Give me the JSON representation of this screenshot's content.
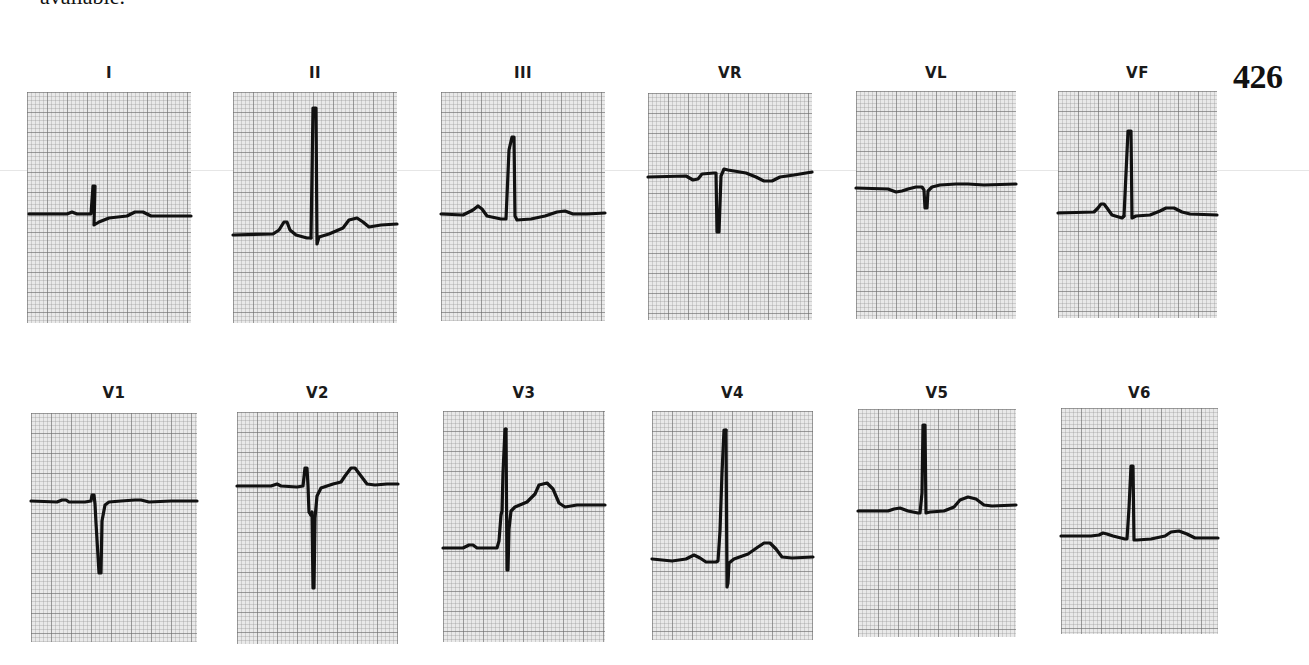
{
  "page": {
    "cut_text": "available.",
    "figure_number": "426"
  },
  "leads": [
    {
      "label": "I",
      "x": 27,
      "label_y": 64,
      "grid_top": 92,
      "w": 164,
      "h": 231,
      "trace": "M2,122 L60,121 L64,119 L67,121 L64,121",
      "path": "M2,122 L40,122 L45,120 L50,122 L64,122 L66,94 L68,94 L67,133 L72,130 L82,126 L100,124 L108,120 L116,120 L124,124 L140,124 L164,124",
      "spike": ""
    },
    {
      "label": "II",
      "x": 233,
      "label_y": 64,
      "grid_top": 92,
      "w": 164,
      "h": 231,
      "path": "M0,143 L40,142 L46,138 L51,130 L54,130 L57,138 L63,143 L74,146 L78,146",
      "spike": "M78,146 L80,16 L83,16 L84,152 L86,145 L96,142 L110,136 L116,128 L124,126 L130,130 L136,135 L148,133 L164,132"
    },
    {
      "label": "III",
      "x": 441,
      "label_y": 64,
      "grid_top": 92,
      "w": 164,
      "h": 229,
      "path": "M0,122 L22,123 L32,118 L37,114 L41,117 L46,124 L60,127 L65,127 L68,58 L71,45 L73,45 L74,124 L76,128 L90,127 L104,124 L116,120 L124,119 L132,122 L146,122 L164,121",
      "spike": ""
    },
    {
      "label": "VR",
      "x": 648,
      "label_y": 64,
      "grid_top": 93,
      "w": 164,
      "h": 227,
      "path": "M0,84 L38,83 L45,87 L50,86 L54,81 L66,80 L68,80 L69,139 L71,139 L73,83 L76,76 L80,77 L98,80 L108,84 L116,88 L124,88 L132,84 L146,82 L164,79",
      "spike": ""
    },
    {
      "label": "VL",
      "x": 856,
      "label_y": 64,
      "grid_top": 91,
      "w": 160,
      "h": 228,
      "path": "M0,97 L32,98 L40,101 L46,100 L52,98 L60,96 L64,96 L66,96 L68,99 L69,117 L71,117 L72,100 L76,96 L84,94 L100,93 L112,93 L128,94 L160,93",
      "spike": ""
    },
    {
      "label": "VF",
      "x": 1058,
      "label_y": 64,
      "grid_top": 91,
      "w": 159,
      "h": 227,
      "path": "M0,122 L36,121 L40,117 L43,113 L46,113 L49,117 L54,124 L64,127 L66,125",
      "spike": "M66,125 L70,40 L73,40 L74,127 L78,125 L92,124 L102,120 L108,117 L116,117 L124,121 L132,123 L159,124"
    },
    {
      "label": "V1",
      "x": 31,
      "label_y": 384,
      "grid_top": 413,
      "w": 166,
      "h": 229,
      "path": "M0,88 L26,89 L31,87 L35,87 L38,89 L54,89 L60,88 L61,82 L63,82 L64,91 L65,110 L68,160 L70,160 L71,108 L74,92 L78,89 L90,88 L104,87 L110,87 L118,89 L140,88 L166,88",
      "spike": ""
    },
    {
      "label": "V2",
      "x": 237,
      "label_y": 384,
      "grid_top": 412,
      "w": 161,
      "h": 232,
      "path": "M0,74 L34,74 L40,72 L44,74 L60,75 L66,74 L68,56 L70,56 L71,74 L72,100 L74,103",
      "spike": "M74,103 L75,100 L76,176 L77,176 L78,106 L80,84 L84,76 L96,72 L104,70 L108,64 L114,56 L118,56 L124,64 L130,72 L138,73 L150,72 L161,72"
    },
    {
      "label": "V3",
      "x": 443,
      "label_y": 384,
      "grid_top": 411,
      "w": 162,
      "h": 231,
      "path": "M0,137 L20,137 L26,134 L30,134 L34,137 L54,137 L56,130 L58,104 L59,100 L60,62 L62,18 L63,18",
      "spike": "M63,18 L63,18 L64,159 L65,159 L66,118 L68,100 L72,96 L84,91 L92,83 L96,74 L104,72 L110,78 L116,92 L122,96 L134,94 L162,94"
    },
    {
      "label": "V4",
      "x": 652,
      "label_y": 384,
      "grid_top": 411,
      "w": 161,
      "h": 229,
      "path": "M0,148 L20,150 L34,148 L42,144 L48,147 L54,151 L64,151 L66,150 L68,120 L70,62 L72,19 L74,19",
      "spike": "M74,19 L74,19 L75,176 L76,172 L77,152 L82,148 L96,143 L106,136 L112,132 L118,132 L124,138 L130,146 L140,147 L161,146"
    },
    {
      "label": "V5",
      "x": 858,
      "label_y": 384,
      "grid_top": 409,
      "w": 158,
      "h": 228,
      "path": "M0,102 L30,102 L36,100 L42,99 L50,102 L60,104 L62,104 L64,84 L65,16 L67,16 L68,104 L72,103 L86,102 L96,98 L102,91 L110,88 L118,90 L126,96 L134,97 L158,96",
      "spike": ""
    },
    {
      "label": "V6",
      "x": 1061,
      "label_y": 384,
      "grid_top": 408,
      "w": 157,
      "h": 226,
      "path": "M0,128 L30,128 L38,127 L42,125 L46,126 L52,128 L64,131 L66,131 L68,100 L70,58 L72,58 L73,132 L76,132 L90,131 L104,128 L110,124 L118,123 L126,126 L134,130 L157,130",
      "spike": ""
    }
  ],
  "chart_data": {
    "type": "ecg-12-lead",
    "title": "",
    "figure_number": "426",
    "layout": {
      "rows": 2,
      "cols": 6,
      "grid": true,
      "grid_minor_px": 4,
      "grid_major_px": 20
    },
    "leads_order": [
      "I",
      "II",
      "III",
      "VR",
      "VL",
      "VF",
      "V1",
      "V2",
      "V3",
      "V4",
      "V5",
      "V6"
    ],
    "qualitative": {
      "I": "small upright R, small S, low upright T",
      "II": "tall narrow R, upright P and T",
      "III": "tall R, upright P and T",
      "VR": "deep QS/S complex, inverted P and T",
      "VL": "small Q/S deflection, flat T",
      "VF": "tall R, upright P and T",
      "V1": "rS with deep S, flat T",
      "V2": "RS with deep S, tall upright T, ST elevation",
      "V3": "tall R, deep S, upright T with ST elevation",
      "V4": "tall R, S wave, upright T",
      "V5": "tall R, upright T",
      "V6": "R wave, upright T"
    }
  }
}
